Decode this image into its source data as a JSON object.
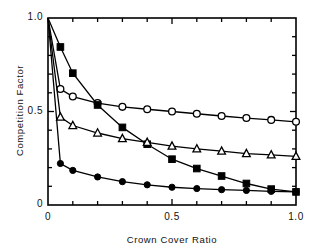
{
  "chart_data": {
    "type": "line",
    "title": "",
    "xlabel": "Crown Cover Ratio",
    "ylabel": "Competition Factor",
    "xlim": [
      0,
      1.0
    ],
    "ylim": [
      0,
      1.0
    ],
    "grid": false,
    "legend": "none",
    "x_tick_labels": [
      "0",
      "0.5",
      "1.0"
    ],
    "x_tick_values": [
      0,
      0.5,
      1.0
    ],
    "y_tick_labels": [
      "0",
      "0.5",
      "1.0"
    ],
    "y_tick_values": [
      0,
      0.5,
      1.0
    ],
    "x_minor_tick_step": 0.1,
    "y_minor_tick_step": 0.1,
    "series": [
      {
        "name": "open-circle-series",
        "marker": "open-circle",
        "x": [
          0,
          0.05,
          0.1,
          0.2,
          0.3,
          0.4,
          0.5,
          0.6,
          0.7,
          0.8,
          0.9,
          1.0
        ],
        "values": [
          1.0,
          0.62,
          0.58,
          0.545,
          0.525,
          0.512,
          0.5,
          0.488,
          0.476,
          0.465,
          0.455,
          0.445
        ]
      },
      {
        "name": "filled-square-series",
        "marker": "filled-square",
        "x": [
          0,
          0.05,
          0.1,
          0.2,
          0.3,
          0.4,
          0.5,
          0.6,
          0.7,
          0.8,
          0.9,
          1.0
        ],
        "values": [
          1.0,
          0.845,
          0.705,
          0.535,
          0.415,
          0.325,
          0.245,
          0.195,
          0.155,
          0.115,
          0.085,
          0.07
        ]
      },
      {
        "name": "open-triangle-series",
        "marker": "open-triangle",
        "x": [
          0,
          0.05,
          0.1,
          0.2,
          0.3,
          0.4,
          0.5,
          0.6,
          0.7,
          0.8,
          0.9,
          1.0
        ],
        "values": [
          1.0,
          0.47,
          0.425,
          0.385,
          0.355,
          0.335,
          0.315,
          0.3,
          0.288,
          0.275,
          0.268,
          0.26
        ]
      },
      {
        "name": "filled-circle-series",
        "marker": "filled-circle",
        "x": [
          0,
          0.05,
          0.1,
          0.2,
          0.3,
          0.4,
          0.5,
          0.6,
          0.7,
          0.8,
          0.9,
          1.0
        ],
        "values": [
          1.0,
          0.222,
          0.185,
          0.15,
          0.125,
          0.108,
          0.095,
          0.088,
          0.082,
          0.078,
          0.073,
          0.07
        ]
      }
    ]
  },
  "axes": {
    "x_label": "Crown Cover Ratio",
    "y_label": "Competition Factor",
    "x_ticks": [
      {
        "label": "0",
        "value": 0
      },
      {
        "label": "0.5",
        "value": 0.5
      },
      {
        "label": "1.0",
        "value": 1.0
      }
    ],
    "y_ticks": [
      {
        "label": "0",
        "value": 0
      },
      {
        "label": "0.5",
        "value": 0.5
      },
      {
        "label": "1.0",
        "value": 1.0
      }
    ]
  },
  "style": {
    "line_color": "#000000",
    "axis_color": "#000000",
    "background": "#ffffff",
    "marker_fill_open": "#ffffff",
    "marker_fill_solid": "#000000"
  }
}
